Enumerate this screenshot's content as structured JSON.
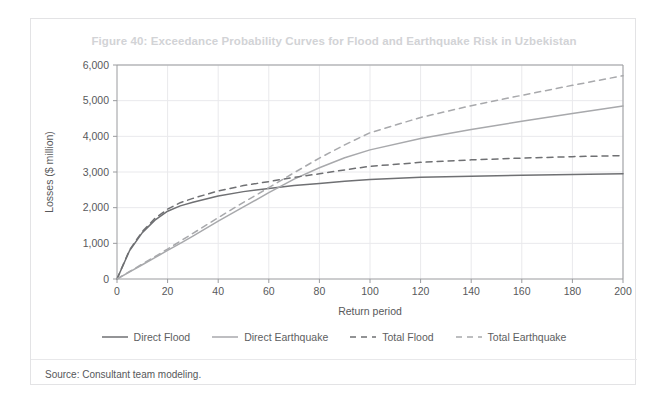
{
  "figure": {
    "title": "Figure 40: Exceedance Probability Curves for Flood and Earthquake Risk in Uzbekistan",
    "source": "Source: Consultant team modeling."
  },
  "legend": {
    "items": [
      {
        "label": "Direct Flood",
        "style": "solid",
        "color": "#6f7073"
      },
      {
        "label": "Direct Earthquake",
        "style": "solid",
        "color": "#a8a9ac"
      },
      {
        "label": "Total Flood",
        "style": "dashed",
        "color": "#6f7073"
      },
      {
        "label": "Total Earthquake",
        "style": "dashed",
        "color": "#a8a9ac"
      }
    ]
  },
  "colors": {
    "flood": "#6f7073",
    "earthquake": "#a8a9ac",
    "grid": "#e9e9ec",
    "axis": "#9a9b9e",
    "title": "#d2d3d6",
    "text": "#58595b",
    "card_border": "#e3e3e5"
  },
  "chart_data": {
    "type": "line",
    "title": "Figure 40: Exceedance Probability Curves for Flood and Earthquake Risk in Uzbekistan",
    "xlabel": "Return period",
    "ylabel": "Losses ($ million)",
    "xlim": [
      0,
      200
    ],
    "ylim": [
      0,
      6000
    ],
    "xticks": [
      0,
      20,
      40,
      60,
      80,
      100,
      120,
      140,
      160,
      180,
      200
    ],
    "yticks": [
      0,
      1000,
      2000,
      3000,
      4000,
      5000,
      6000
    ],
    "xtick_labels": [
      "0",
      "20",
      "40",
      "60",
      "80",
      "100",
      "120",
      "140",
      "160",
      "180",
      "200"
    ],
    "ytick_labels": [
      "0",
      "1,000",
      "2,000",
      "3,000",
      "4,000",
      "5,000",
      "6,000"
    ],
    "grid": true,
    "legend_position": "bottom",
    "x": [
      0,
      5,
      10,
      15,
      20,
      25,
      30,
      40,
      50,
      60,
      70,
      80,
      90,
      100,
      120,
      140,
      160,
      180,
      200
    ],
    "series": [
      {
        "name": "Direct Flood",
        "style": "solid",
        "color": "#6f7073",
        "values": [
          0,
          800,
          1300,
          1650,
          1900,
          2050,
          2150,
          2330,
          2450,
          2540,
          2620,
          2680,
          2740,
          2790,
          2850,
          2880,
          2910,
          2930,
          2950
        ]
      },
      {
        "name": "Direct Earthquake",
        "style": "solid",
        "color": "#a8a9ac",
        "values": [
          0,
          200,
          400,
          600,
          800,
          1000,
          1200,
          1620,
          2020,
          2420,
          2800,
          3120,
          3400,
          3620,
          3940,
          4190,
          4420,
          4640,
          4850
        ]
      },
      {
        "name": "Total Flood",
        "style": "dashed",
        "color": "#6f7073",
        "values": [
          0,
          820,
          1330,
          1700,
          1960,
          2140,
          2260,
          2470,
          2620,
          2730,
          2850,
          2950,
          3060,
          3160,
          3270,
          3340,
          3390,
          3430,
          3460
        ]
      },
      {
        "name": "Total Earthquake",
        "style": "dashed",
        "color": "#a8a9ac",
        "values": [
          0,
          210,
          420,
          630,
          840,
          1060,
          1280,
          1720,
          2150,
          2560,
          2980,
          3390,
          3760,
          4100,
          4530,
          4860,
          5150,
          5430,
          5700
        ]
      }
    ]
  }
}
